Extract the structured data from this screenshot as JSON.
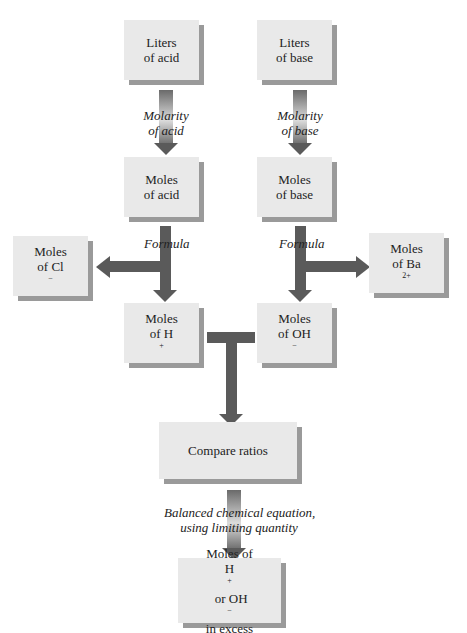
{
  "boxes": {
    "liters_acid": {
      "line1": "Liters",
      "line2": "of acid"
    },
    "liters_base": {
      "line1": "Liters",
      "line2": "of base"
    },
    "moles_acid": {
      "line1": "Moles",
      "line2": "of acid"
    },
    "moles_base": {
      "line1": "Moles",
      "line2": "of base"
    },
    "moles_cl": {
      "line1": "Moles",
      "line2": "of Cl",
      "sup": "−"
    },
    "moles_ba": {
      "line1": "Moles",
      "line2": "of Ba",
      "sup": "2+"
    },
    "moles_h": {
      "line1": "Moles",
      "line2": "of H",
      "sup": "+"
    },
    "moles_oh": {
      "line1": "Moles",
      "line2": "of OH",
      "sup": "−"
    },
    "compare": {
      "line1": "Compare ratios"
    },
    "excess": {
      "line1": "Moles of",
      "line2a": "H",
      "sup1": "+",
      "line2b": " or OH",
      "sup2": "−",
      "line3": "in excess"
    }
  },
  "labels": {
    "molarity_acid": {
      "line1": "Molarity",
      "line2": "of acid"
    },
    "molarity_base": {
      "line1": "Molarity",
      "line2": "of base"
    },
    "formula_acid": "Formula",
    "formula_base": "Formula",
    "balanced": {
      "line1": "Balanced chemical equation,",
      "line2": "using limiting quantity"
    }
  },
  "colors": {
    "box_fill": "#e9e9e9",
    "box_shadow": "#9a9a9a",
    "arrow": "#5a5a5a"
  }
}
